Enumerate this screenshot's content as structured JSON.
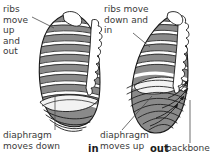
{
  "figure": {
    "background_color": "#ffffff",
    "rib_fill_color": "#808080",
    "rib_outline_color": "#1a1a1a",
    "text_color": "#3a3a3a",
    "panels": [
      {
        "id": "inhale",
        "caption": "in",
        "rib_label": "ribs\nmove\nup\nand\nout",
        "diaphragm_label": "diaphragm\nmoves down"
      },
      {
        "id": "exhale",
        "caption": "out",
        "rib_label": "ribs move\ndown and\nin",
        "diaphragm_label": "diaphragm\nmoves up",
        "backbone_label": "backbone"
      }
    ]
  },
  "labels": {
    "ribs_in": "ribs\nmove\nup\nand\nout",
    "ribs_out": "ribs move\ndown and\nin",
    "diaphragm_in": "diaphragm\nmoves down",
    "diaphragm_out": "diaphragm\nmoves up",
    "backbone": "backbone",
    "caption_in": "in",
    "caption_out": "out"
  }
}
